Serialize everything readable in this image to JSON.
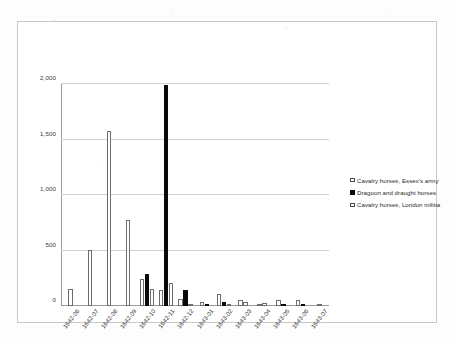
{
  "chart_data": {
    "type": "bar",
    "title": "",
    "subtitle": "",
    "xlabel": "",
    "ylabel": "",
    "ylim": [
      0,
      2000
    ],
    "yticks": [
      0,
      500,
      1000,
      1500,
      2000
    ],
    "ytick_labels": [
      "0",
      "500",
      "1,000",
      "1,500",
      "2,000"
    ],
    "grid": true,
    "legend_position": "right",
    "categories": [
      "1642-06",
      "1642-07",
      "1642-08",
      "1642-09",
      "1642-10",
      "1642-11",
      "1642-12",
      "1643-01",
      "1643-02",
      "1643-03",
      "1643-04",
      "1643-05",
      "1643-06",
      "1643-07"
    ],
    "series": [
      {
        "name": "Cavalry horses, Essex's army",
        "style": "open",
        "color": "#ffffff",
        "edge_color": "#6d6d6d",
        "values": [
          150,
          505,
          1575,
          775,
          245,
          140,
          60,
          40,
          105,
          55,
          20,
          50,
          55,
          10
        ]
      },
      {
        "name": "Dragoon and draught horses",
        "style": "solid",
        "color": "#0a0a0a",
        "edge_color": "#0a0a0a",
        "values": [
          0,
          0,
          0,
          0,
          290,
          1990,
          145,
          20,
          35,
          0,
          0,
          10,
          15,
          0
        ]
      },
      {
        "name": "Cavalry horses, London militia",
        "style": "open",
        "color": "#ffffff",
        "edge_color": "#6d6d6d",
        "values": [
          0,
          0,
          0,
          0,
          155,
          210,
          5,
          0,
          5,
          40,
          25,
          0,
          0,
          0
        ]
      }
    ]
  }
}
